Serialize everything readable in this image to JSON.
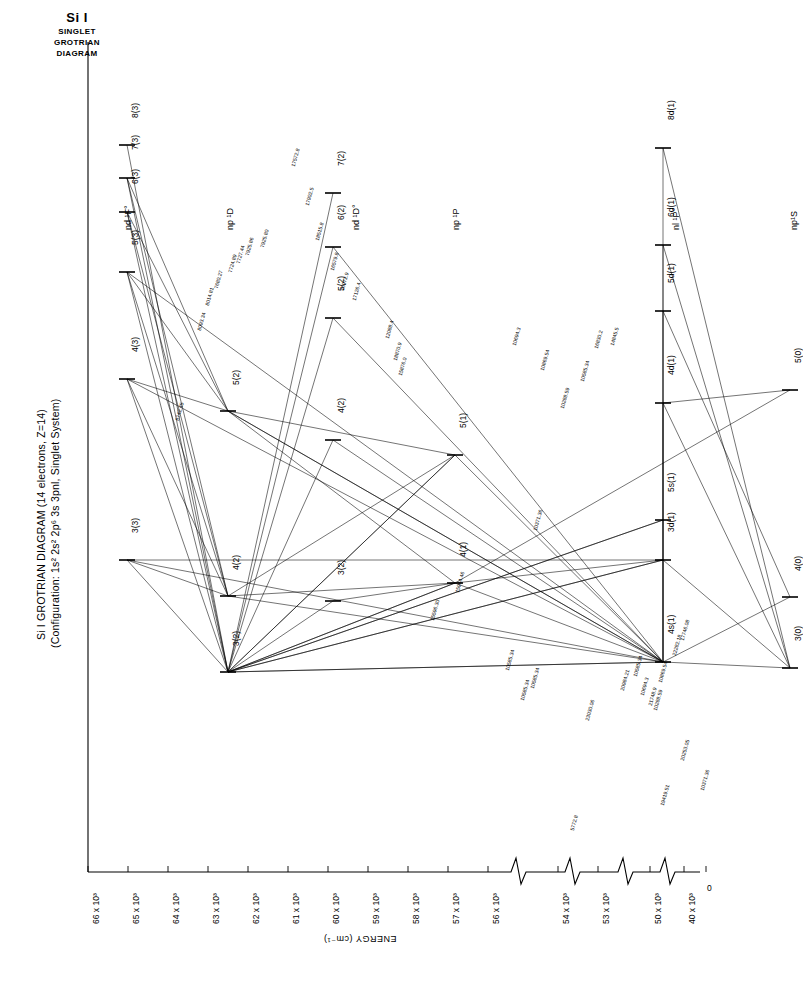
{
  "corner_title": {
    "line1": "Si I",
    "line2": "SINGLET",
    "line3": "GROTRIAN",
    "line4": "DIAGRAM"
  },
  "main_title": {
    "line1": "Si I  GROTRIAN  DIAGRAM  (14 electrons, Z=14)",
    "line2": "(Configuration: 1s² 2s² 2p⁶ 3s 3pnl, Singlet System)"
  },
  "axis": {
    "title": "ENERGY (cm⁻¹)",
    "tick_labels": [
      "66 x 10³",
      "65 x 10³",
      "64 x 10³",
      "63 x 10³",
      "62 x 10³",
      "61 x 10³",
      "60 x 10³",
      "59 x 10³",
      "58 x 10³",
      "57 x 10³",
      "56 x 10³",
      "54 x 10³",
      "53 x 10³",
      "50 x 10³",
      "40 x 10³",
      "0"
    ]
  },
  "columns": [
    {
      "id": "nd1Fo",
      "label": "nd ¹F°"
    },
    {
      "id": "np1D",
      "label": "np ¹D"
    },
    {
      "id": "nd1Do",
      "label": "nd ¹D°"
    },
    {
      "id": "np1P",
      "label": "np ¹P"
    },
    {
      "id": "nl1Po",
      "label": "nl ¹P°"
    },
    {
      "id": "np1S",
      "label": "np¹S"
    }
  ],
  "levels": [
    {
      "col": "nd1Fo",
      "label": "8(3)"
    },
    {
      "col": "nd1Fo",
      "label": "7(3)"
    },
    {
      "col": "nd1Fo",
      "label": "6(3)"
    },
    {
      "col": "nd1Fo",
      "label": "5(3)"
    },
    {
      "col": "nd1Fo",
      "label": "4(3)"
    },
    {
      "col": "nd1Fo",
      "label": "3(3)"
    },
    {
      "col": "np1D",
      "label": "5(2)"
    },
    {
      "col": "np1D",
      "label": "4(2)"
    },
    {
      "col": "np1D",
      "label": "3(2)"
    },
    {
      "col": "nd1Do",
      "label": "7(2)"
    },
    {
      "col": "nd1Do",
      "label": "6(2)"
    },
    {
      "col": "nd1Do",
      "label": "5(2)"
    },
    {
      "col": "nd1Do",
      "label": "4(2)"
    },
    {
      "col": "nd1Do",
      "label": "3(2)"
    },
    {
      "col": "np1P",
      "label": "5(1)"
    },
    {
      "col": "np1P",
      "label": "4(1)"
    },
    {
      "col": "nl1Po",
      "label": "8d(1)"
    },
    {
      "col": "nl1Po",
      "label": "6d(1)"
    },
    {
      "col": "nl1Po",
      "label": "5d(1)"
    },
    {
      "col": "nl1Po",
      "label": "4d(1)"
    },
    {
      "col": "nl1Po",
      "label": "5s(1)"
    },
    {
      "col": "nl1Po",
      "label": "3d(1)"
    },
    {
      "col": "nl1Po",
      "label": "4s(1)"
    },
    {
      "col": "np1S",
      "label": "5(0)"
    },
    {
      "col": "np1S",
      "label": "4(0)"
    },
    {
      "col": "np1S",
      "label": "3(0)"
    }
  ],
  "transitions": [
    "7925.80",
    "7925.86",
    "7727.44",
    "7724.89",
    "7680.27",
    "8014.81",
    "8093.34",
    "8742.45",
    "17572.8",
    "17902.5",
    "18515.8",
    "16579.8",
    "16972.9",
    "17126.4",
    "12088.4",
    "18870.9",
    "15876.0",
    "14845.5",
    "16830.2",
    "10585.34",
    "10869.54",
    "10694.3",
    "10371.36",
    "10288.59",
    "10585.34",
    "15964.46",
    "15596.30",
    "17746.08",
    "21748.9",
    "20984.21",
    "23030.06",
    "10585.34",
    "10694.3",
    "10288.59",
    "10869.54",
    "10585.34",
    "10371.36",
    "19419.51",
    "5772.8",
    "20253.05",
    "10585.34",
    "22282.18"
  ],
  "chart_data": {
    "type": "scatter",
    "title": "Si I GROTRIAN DIAGRAM (14 electrons, Z=14)",
    "subtitle": "(Configuration: 1s² 2s² 2p⁶ 3s 3pnl, Singlet System)",
    "xlabel": "",
    "ylabel": "ENERGY (cm⁻¹)",
    "ylim": [
      0,
      66000
    ],
    "grid": false,
    "legend": "none",
    "categories": [
      "nd ¹F°",
      "np ¹D",
      "nd ¹D°",
      "np ¹P",
      "nl ¹P°",
      "np¹S"
    ],
    "series": [
      {
        "name": "nd ¹F°",
        "points": [
          {
            "label": "8(3)",
            "energy": 65800
          },
          {
            "label": "7(3)",
            "energy": 65600
          },
          {
            "label": "6(3)",
            "energy": 65200
          },
          {
            "label": "5(3)",
            "energy": 64500
          },
          {
            "label": "4(3)",
            "energy": 62600
          },
          {
            "label": "3(3)",
            "energy": 54500
          }
        ]
      },
      {
        "name": "np ¹D",
        "points": [
          {
            "label": "5(2)",
            "energy": 59500
          },
          {
            "label": "4(2)",
            "energy": 54200
          },
          {
            "label": "3(2)",
            "energy": 53400
          }
        ]
      },
      {
        "name": "nd ¹D°",
        "points": [
          {
            "label": "7(2)",
            "energy": 63200
          },
          {
            "label": "6(2)",
            "energy": 62700
          },
          {
            "label": "5(2)",
            "energy": 61600
          },
          {
            "label": "4(2)",
            "energy": 59000
          },
          {
            "label": "3(2)",
            "energy": 54100
          }
        ]
      },
      {
        "name": "np ¹P",
        "points": [
          {
            "label": "5(1)",
            "energy": 59600
          },
          {
            "label": "4(1)",
            "energy": 54400
          }
        ]
      },
      {
        "name": "nl ¹P°",
        "points": [
          {
            "label": "8d(1)",
            "energy": 65700
          },
          {
            "label": "6d(1)",
            "energy": 63000
          },
          {
            "label": "5d(1)",
            "energy": 61300
          },
          {
            "label": "4d(1)",
            "energy": 58500
          },
          {
            "label": "5s(1)",
            "energy": 54300
          },
          {
            "label": "3d(1)",
            "energy": 53300
          },
          {
            "label": "4s(1)",
            "energy": 50300
          }
        ]
      },
      {
        "name": "np¹S",
        "points": [
          {
            "label": "5(0)",
            "energy": 57500
          },
          {
            "label": "4(0)",
            "energy": 53400
          },
          {
            "label": "3(0)",
            "energy": 40000
          }
        ]
      }
    ]
  }
}
